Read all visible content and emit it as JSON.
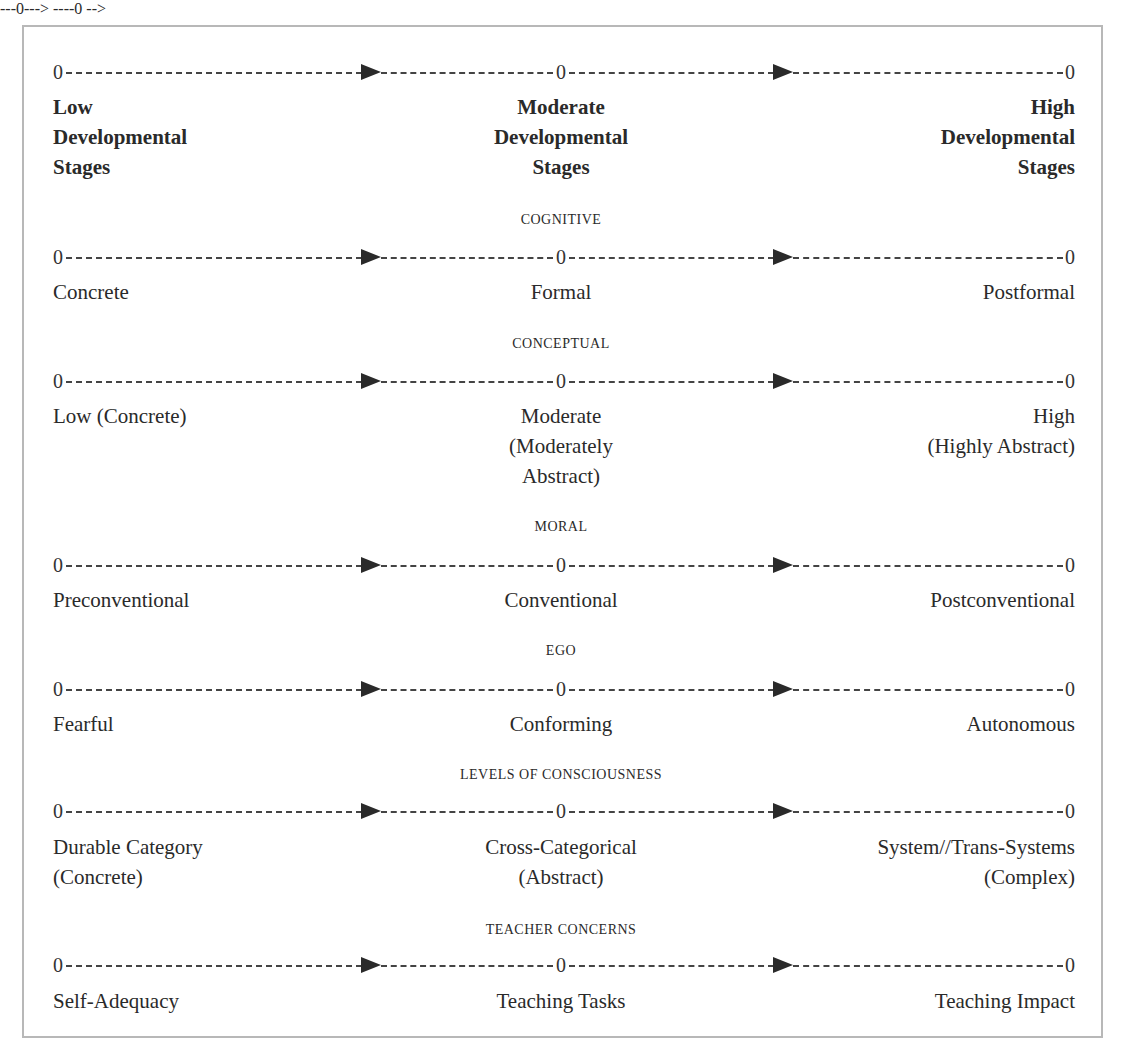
{
  "header": {
    "low": [
      "Low",
      "Developmental",
      "Stages"
    ],
    "moderate": [
      "Moderate",
      "Developmental",
      "Stages"
    ],
    "high": [
      "High",
      "Developmental",
      "Stages"
    ]
  },
  "scale_marker": "0",
  "domains": [
    {
      "title": "COGNITIVE",
      "low": [
        "Concrete"
      ],
      "moderate": [
        "Formal"
      ],
      "high": [
        "Postformal"
      ]
    },
    {
      "title": "CONCEPTUAL",
      "low": [
        "Low (Concrete)"
      ],
      "moderate": [
        "Moderate",
        "(Moderately",
        "Abstract)"
      ],
      "high": [
        "High",
        "(Highly Abstract)"
      ]
    },
    {
      "title": "MORAL",
      "low": [
        "Preconventional"
      ],
      "moderate": [
        "Conventional"
      ],
      "high": [
        "Postconventional"
      ]
    },
    {
      "title": "EGO",
      "low": [
        "Fearful"
      ],
      "moderate": [
        "Conforming"
      ],
      "high": [
        "Autonomous"
      ]
    },
    {
      "title": "LEVELS OF CONSCIOUSNESS",
      "low": [
        "Durable Category",
        "(Concrete)"
      ],
      "moderate": [
        "Cross-Categorical",
        "(Abstract)"
      ],
      "high": [
        "System//Trans-Systems",
        "(Complex)"
      ]
    },
    {
      "title": "TEACHER CONCERNS",
      "low": [
        "Self-Adequacy"
      ],
      "moderate": [
        "Teaching Tasks"
      ],
      "high": [
        "Teaching Impact"
      ]
    }
  ]
}
